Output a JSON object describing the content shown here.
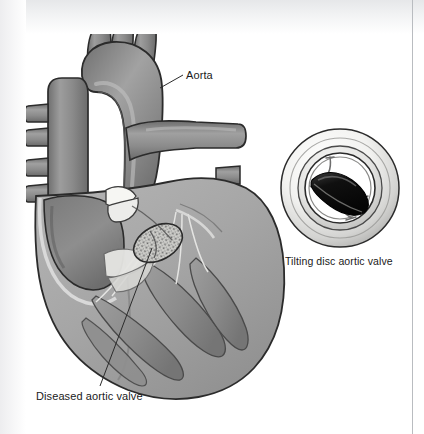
{
  "figure": {
    "background_color": "#ffffff",
    "width": 424,
    "height": 434
  },
  "labels": {
    "aorta": "Aorta",
    "diseased_valve": "Diseased aortic valve",
    "inset_caption": "Tilting disc aortic valve"
  },
  "palette": {
    "outline": "#2b2b2b",
    "muscle_mid": "#9a9a9a",
    "muscle_light": "#b3b3b3",
    "muscle_dark": "#7d7d7d",
    "vessel_dark": "#767676",
    "vessel_mid": "#8d8d8d",
    "chamber_shadow": "#6e6e6e",
    "leaflet_white": "#f4f4f2",
    "calcified_fill": "#c9c9c5",
    "calcified_speck": "#6f6f6f",
    "prosthesis_disc": "#161616",
    "prosthesis_ring": "#f0f0ee",
    "prosthesis_ring_shade": "#c6c6c4",
    "text": "#1a1a1a",
    "leader_line": "#2b2b2b",
    "scan_edge": "#b9bcc0"
  },
  "anatomy_parts": [
    "aortic arch",
    "brachiocephalic trunk",
    "left common carotid artery",
    "left subclavian artery",
    "superior vena cava",
    "pulmonary veins",
    "pulmonary artery",
    "left atrium",
    "left ventricle",
    "mitral valve leaflets",
    "chordae tendineae",
    "papillary muscles",
    "aortic valve cusps",
    "calcified aortic valve"
  ],
  "inset": {
    "device": "tilting disc aortic valve prosthesis",
    "components": [
      "sewing ring",
      "valve housing",
      "tilting disc occluder",
      "struts"
    ],
    "center_x": 340,
    "center_y": 188,
    "outer_radius": 60
  }
}
